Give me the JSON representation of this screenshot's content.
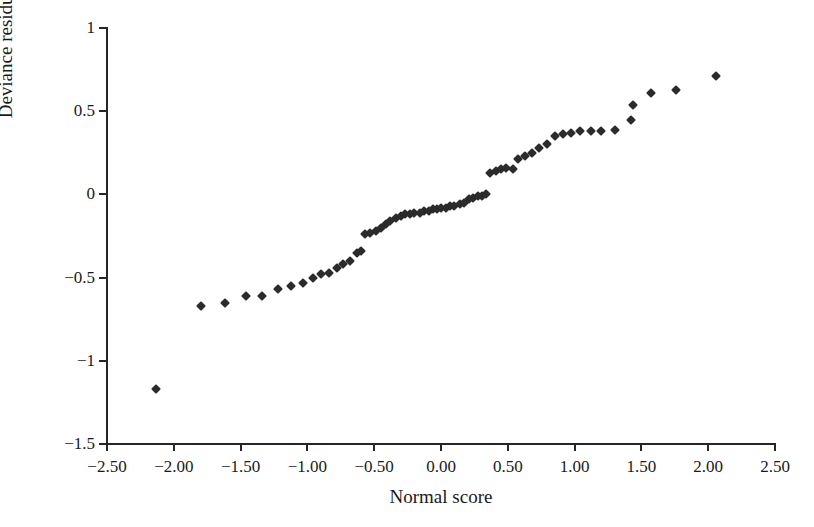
{
  "chart_data": {
    "type": "scatter",
    "title": "",
    "xlabel": "Normal score",
    "ylabel": "Deviance residual",
    "xlim": [
      -2.5,
      2.5
    ],
    "ylim": [
      -1.5,
      1.0
    ],
    "xticks": [
      -2.5,
      -2.0,
      -1.5,
      -1.0,
      -0.5,
      0.0,
      0.5,
      1.0,
      1.5,
      2.0,
      2.5
    ],
    "xtick_labels": [
      "−2.50",
      "−2.00",
      "−1.50",
      "−1.00",
      "−0.50",
      "0.00",
      "0.50",
      "1.00",
      "1.50",
      "2.00",
      "2.50"
    ],
    "yticks": [
      -1.5,
      -1.0,
      -0.5,
      0.0,
      0.5,
      1.0
    ],
    "ytick_labels": [
      "−1.5",
      "−1",
      "−0.5",
      "0",
      "0.5",
      "1"
    ],
    "grid": false,
    "legend": "none",
    "marker": "diamond",
    "marker_color": "#2b2b2b",
    "series": [
      {
        "name": "Deviance residual vs normal score",
        "points": [
          [
            -2.13,
            -1.17
          ],
          [
            -1.8,
            -0.67
          ],
          [
            -1.62,
            -0.65
          ],
          [
            -1.46,
            -0.61
          ],
          [
            -1.34,
            -0.61
          ],
          [
            -1.22,
            -0.57
          ],
          [
            -1.12,
            -0.55
          ],
          [
            -1.03,
            -0.53
          ],
          [
            -0.96,
            -0.5
          ],
          [
            -0.9,
            -0.48
          ],
          [
            -0.84,
            -0.47
          ],
          [
            -0.78,
            -0.44
          ],
          [
            -0.73,
            -0.42
          ],
          [
            -0.68,
            -0.4
          ],
          [
            -0.63,
            -0.35
          ],
          [
            -0.6,
            -0.34
          ],
          [
            -0.57,
            -0.24
          ],
          [
            -0.53,
            -0.23
          ],
          [
            -0.49,
            -0.22
          ],
          [
            -0.45,
            -0.2
          ],
          [
            -0.41,
            -0.18
          ],
          [
            -0.38,
            -0.16
          ],
          [
            -0.34,
            -0.14
          ],
          [
            -0.3,
            -0.13
          ],
          [
            -0.27,
            -0.12
          ],
          [
            -0.23,
            -0.12
          ],
          [
            -0.2,
            -0.11
          ],
          [
            -0.16,
            -0.11
          ],
          [
            -0.13,
            -0.1
          ],
          [
            -0.09,
            -0.1
          ],
          [
            -0.06,
            -0.09
          ],
          [
            -0.03,
            -0.09
          ],
          [
            0.0,
            -0.08
          ],
          [
            0.04,
            -0.08
          ],
          [
            0.07,
            -0.07
          ],
          [
            0.1,
            -0.07
          ],
          [
            0.14,
            -0.06
          ],
          [
            0.17,
            -0.05
          ],
          [
            0.21,
            -0.03
          ],
          [
            0.24,
            -0.02
          ],
          [
            0.28,
            -0.01
          ],
          [
            0.31,
            -0.01
          ],
          [
            0.34,
            0.0
          ],
          [
            0.37,
            0.13
          ],
          [
            0.41,
            0.14
          ],
          [
            0.45,
            0.15
          ],
          [
            0.49,
            0.16
          ],
          [
            0.54,
            0.15
          ],
          [
            0.58,
            0.21
          ],
          [
            0.63,
            0.23
          ],
          [
            0.68,
            0.25
          ],
          [
            0.73,
            0.28
          ],
          [
            0.79,
            0.3
          ],
          [
            0.85,
            0.35
          ],
          [
            0.91,
            0.36
          ],
          [
            0.97,
            0.37
          ],
          [
            1.04,
            0.38
          ],
          [
            1.12,
            0.38
          ],
          [
            1.2,
            0.38
          ],
          [
            1.3,
            0.39
          ],
          [
            1.42,
            0.45
          ],
          [
            1.44,
            0.54
          ],
          [
            1.57,
            0.61
          ],
          [
            1.76,
            0.63
          ],
          [
            2.06,
            0.71
          ]
        ]
      }
    ]
  }
}
